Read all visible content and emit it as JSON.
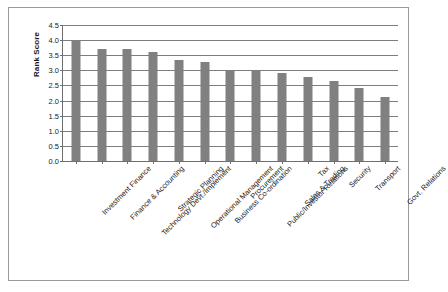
{
  "chart_data": {
    "type": "bar",
    "title": "",
    "xlabel": "",
    "ylabel": "Rank Score",
    "ylim": [
      0,
      4.5
    ],
    "ytick_step": 0.5,
    "grid": true,
    "legend": "none",
    "orientation": "vertical",
    "bar_color": "#808080",
    "categories": [
      "Investment Finance",
      "Finance & Accounting",
      "Technology Devt./Implement",
      "Strategic Planning",
      "Operational Management",
      "Business Co-ordination",
      "Procurement",
      "Public/Investor Relations",
      "Sales & Trading",
      "Tax",
      "Security",
      "Transport",
      "Govt. Relations"
    ],
    "values": [
      4.0,
      3.7,
      3.69,
      3.6,
      3.35,
      3.28,
      2.97,
      2.97,
      2.92,
      2.78,
      2.65,
      2.42,
      2.11
    ],
    "ytick_labels": [
      "0.0",
      "0.5",
      "1.0",
      "1.5",
      "2.0",
      "2.5",
      "3.0",
      "3.5",
      "4.0",
      "4.5"
    ],
    "ytick_values": [
      0.0,
      0.5,
      1.0,
      1.5,
      2.0,
      2.5,
      3.0,
      3.5,
      4.0,
      4.5
    ]
  },
  "axis": {
    "y_title": "Rank Score"
  }
}
